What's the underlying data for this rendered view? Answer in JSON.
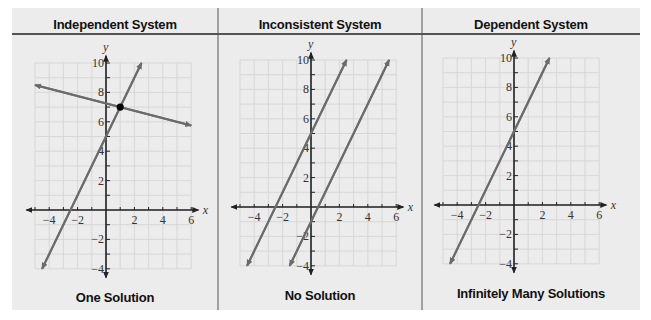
{
  "figure": {
    "background": "#ececec",
    "line_color": "#6b6b6b",
    "grid_color": "#d2d2d2",
    "axis_color": "#222222"
  },
  "panels": [
    {
      "title": "Independent System",
      "caption": "One Solution"
    },
    {
      "title": "Inconsistent System",
      "caption": "No Solution"
    },
    {
      "title": "Dependent System",
      "caption": "Infinitely Many Solutions"
    }
  ],
  "chart_data": [
    {
      "type": "line",
      "title": "Independent System",
      "subtitle": "One Solution",
      "xlabel": "x",
      "ylabel": "y",
      "xlim": [
        -5,
        6
      ],
      "ylim": [
        -4,
        10
      ],
      "x_ticks": [
        -4,
        -2,
        2,
        4,
        6
      ],
      "y_ticks": [
        -4,
        -2,
        2,
        4,
        6,
        8,
        10
      ],
      "grid": true,
      "series": [
        {
          "name": "line 1",
          "equation": "y = 2x + 5",
          "from": [
            -4.5,
            -4
          ],
          "to": [
            2.5,
            10
          ]
        },
        {
          "name": "line 2",
          "equation": "y = -0.25x + 7.25",
          "from": [
            -5,
            8.5
          ],
          "to": [
            6,
            5.75
          ]
        }
      ],
      "annotations": [
        {
          "type": "point",
          "x": 1,
          "y": 7,
          "label": "intersection"
        }
      ]
    },
    {
      "type": "line",
      "title": "Inconsistent System",
      "subtitle": "No Solution",
      "xlabel": "x",
      "ylabel": "y",
      "xlim": [
        -5,
        6
      ],
      "ylim": [
        -4,
        10
      ],
      "x_ticks": [
        -4,
        -2,
        2,
        4,
        6
      ],
      "y_ticks": [
        -4,
        -2,
        2,
        4,
        6,
        8,
        10
      ],
      "grid": true,
      "series": [
        {
          "name": "line 1",
          "equation": "y = 2x + 5",
          "from": [
            -4.5,
            -4
          ],
          "to": [
            2.5,
            10
          ]
        },
        {
          "name": "line 2",
          "equation": "y = 2x - 1",
          "from": [
            -1.5,
            -4
          ],
          "to": [
            5.5,
            10
          ]
        }
      ]
    },
    {
      "type": "line",
      "title": "Dependent System",
      "subtitle": "Infinitely Many Solutions",
      "xlabel": "x",
      "ylabel": "y",
      "xlim": [
        -5,
        6
      ],
      "ylim": [
        -4,
        10
      ],
      "x_ticks": [
        -4,
        -2,
        2,
        4,
        6
      ],
      "y_ticks": [
        -4,
        -2,
        2,
        4,
        6,
        8,
        10
      ],
      "grid": true,
      "series": [
        {
          "name": "coincident lines",
          "equation": "y = 2x + 5",
          "from": [
            -4.5,
            -4
          ],
          "to": [
            2.5,
            10
          ]
        }
      ]
    }
  ]
}
